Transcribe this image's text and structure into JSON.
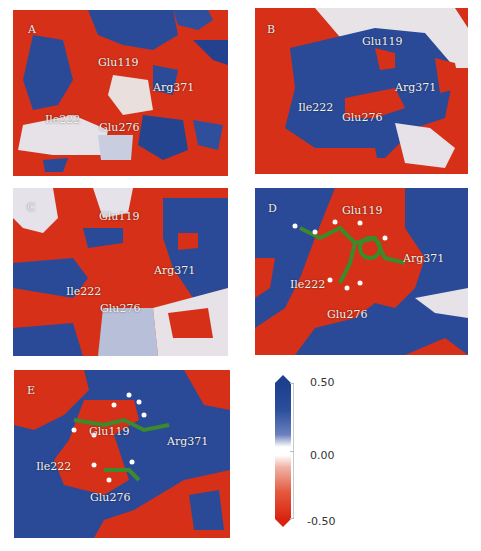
{
  "figure": {
    "panels": [
      {
        "id": "A",
        "letter": "A",
        "residues": {
          "glu119": "Glu119",
          "arg371": "Arg371",
          "ile222": "Ile222",
          "glu276": "Glu276"
        },
        "ligand": false
      },
      {
        "id": "B",
        "letter": "B",
        "residues": {
          "glu119": "Glu119",
          "arg371": "Arg371",
          "ile222": "Ile222",
          "glu276": "Glu276"
        },
        "ligand": false
      },
      {
        "id": "C",
        "letter": "C",
        "residues": {
          "glu119": "Glu119",
          "arg371": "Arg371",
          "ile222": "Ile222",
          "glu276": "Glu276"
        },
        "ligand": false
      },
      {
        "id": "D",
        "letter": "D",
        "residues": {
          "glu119": "Glu119",
          "arg371": "Arg371",
          "ile222": "Ile222",
          "glu276": "Glu276"
        },
        "ligand": true
      },
      {
        "id": "E",
        "letter": "E",
        "residues": {
          "glu119": "Glu119",
          "arg371": "Arg371",
          "ile222": "Ile222",
          "glu276": "Glu276"
        },
        "ligand": true
      }
    ],
    "colorbar": {
      "max_label": "0.50",
      "mid_label": "0.00",
      "min_label": "-0.50",
      "max_color": "#1d3f8e",
      "mid_color": "#ffffff",
      "min_color": "#d8240f"
    },
    "colors": {
      "positive_blue": "#2a4a98",
      "negative_red": "#d9321a",
      "neutral_white": "#ece8ea",
      "ligand_green": "#3c8a2c"
    }
  }
}
